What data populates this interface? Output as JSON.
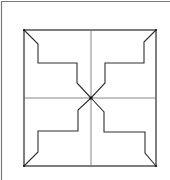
{
  "figure": {
    "colors": {
      "background": "#ffffff",
      "frame": "#7a7a7a",
      "square": "#3a3a3a",
      "cross": "#6a6a6a",
      "arms": "#2e2e2e",
      "center_dot": "#111111"
    },
    "frame": {
      "top": {
        "x1": 1,
        "y1": 1.5,
        "x2": 170,
        "y2": 1.5
      },
      "left": {
        "x1": 1.5,
        "y1": 1,
        "x2": 1.5,
        "y2": 180
      }
    },
    "square": {
      "x": 24,
      "y": 30,
      "width": 132,
      "height": 136
    },
    "center": {
      "x": 91,
      "y": 98
    },
    "cross": {
      "vertical": {
        "x1": 91,
        "y1": 30,
        "x2": 91,
        "y2": 166
      },
      "horizontal": {
        "x1": 24,
        "y1": 98,
        "x2": 156,
        "y2": 98
      }
    },
    "arms": [
      {
        "name": "upper-left",
        "points": "24,30 38,44 38,63 77,63 77,83 91,98"
      },
      {
        "name": "upper-right",
        "points": "156,30 144,42 144,63 105,63 105,83 91,98"
      },
      {
        "name": "lower-left",
        "points": "91,98 78,110 78,131 38,131 38,152 24,166"
      },
      {
        "name": "lower-right",
        "points": "91,98 104,112 104,132 145,132 145,153 156,166"
      }
    ]
  }
}
